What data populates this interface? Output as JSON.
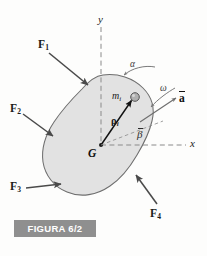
{
  "figure": {
    "caption": "FIGURA 6/2",
    "caption_bg": "#8f8f8f",
    "caption_color": "#ffffff",
    "body_fill": "#e2e2e2",
    "body_stroke": "#6e6e6e",
    "axis_color": "#8a8a8a",
    "arrow_color": "#4a4a4a",
    "vector_color": "#111111",
    "particle_fill": "#b0b0b0",
    "particle_stroke": "#555555"
  },
  "axes": {
    "y_label": "y",
    "x_label": "x",
    "origin_label": "G"
  },
  "forces": [
    {
      "name": "F1",
      "base": "F",
      "sub": "1"
    },
    {
      "name": "F2",
      "base": "F",
      "sub": "2"
    },
    {
      "name": "F3",
      "base": "F",
      "sub": "3"
    },
    {
      "name": "F4",
      "base": "F",
      "sub": "4"
    }
  ],
  "annotations": {
    "alpha": "α",
    "omega": "ω",
    "beta": "β",
    "accel_base": "a",
    "mass_base": "m",
    "mass_sub": "i",
    "rho_base": "ρ",
    "rho_sub": "i"
  }
}
